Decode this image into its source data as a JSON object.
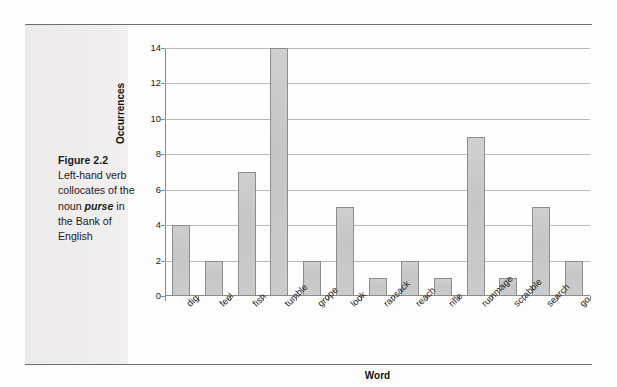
{
  "caption": {
    "figure_label": "Figure 2.2",
    "line1": "Left-hand verb",
    "line2": "collocates of the",
    "line3_before": "noun ",
    "line3_emphasis": "purse",
    "line3_after": " in",
    "line4": "the Bank of",
    "line5": "English"
  },
  "chart_data": {
    "type": "bar",
    "title": "",
    "xlabel": "Word",
    "ylabel": "Occurrences",
    "categories": [
      "dig",
      "feel",
      "fish",
      "tumble",
      "grope",
      "look",
      "ransack",
      "reach",
      "rifle",
      "rummage",
      "scrabble",
      "search",
      "go"
    ],
    "values": [
      4,
      2,
      7,
      14,
      2,
      5,
      1,
      2,
      1,
      9,
      1,
      5,
      2
    ],
    "ylim": [
      0,
      14
    ],
    "ytick_labels": [
      "0",
      "2",
      "4",
      "6",
      "8",
      "10",
      "12",
      "14"
    ],
    "ytick_values": [
      0,
      2,
      4,
      6,
      8,
      10,
      12,
      14
    ],
    "grid": "horizontal",
    "legend": "none",
    "bar_color": "#c8c8c8",
    "bar_border_color": "#8d8d8d",
    "gridline_color": "#b9b9b9",
    "axis_color": "#8a8a8a"
  }
}
